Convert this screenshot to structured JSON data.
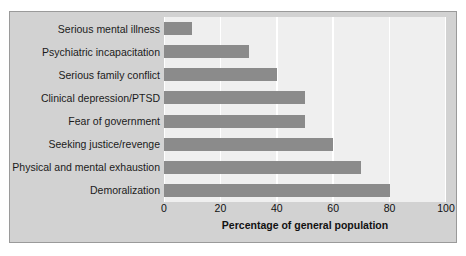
{
  "chart_data": {
    "type": "bar",
    "orientation": "horizontal",
    "title": "",
    "xlabel": "Percentage of general population",
    "ylabel": "",
    "categories": [
      "Serious mental illness",
      "Psychiatric incapacitation",
      "Serious family conflict",
      "Clinical depression/PTSD",
      "Fear of government",
      "Seeking justice/revenge",
      "Physical and mental exhaustion",
      "Demoralization"
    ],
    "values": [
      10,
      30,
      40,
      50,
      50,
      60,
      70,
      80
    ],
    "xlim": [
      0,
      100
    ],
    "xticks": [
      0,
      20,
      40,
      60,
      80,
      100
    ],
    "xtick_labels": [
      "0",
      "20",
      "40",
      "60",
      "80",
      "100"
    ],
    "grid": "vertical-white-gridlines",
    "legend": "none",
    "colors": {
      "bar": "#8b8b8b",
      "plot_background": "#efefef",
      "figure_background": "#d2d2d2",
      "figure_border": "#9a9a9a",
      "gridline": "#ffffff",
      "text": "#111111"
    }
  }
}
